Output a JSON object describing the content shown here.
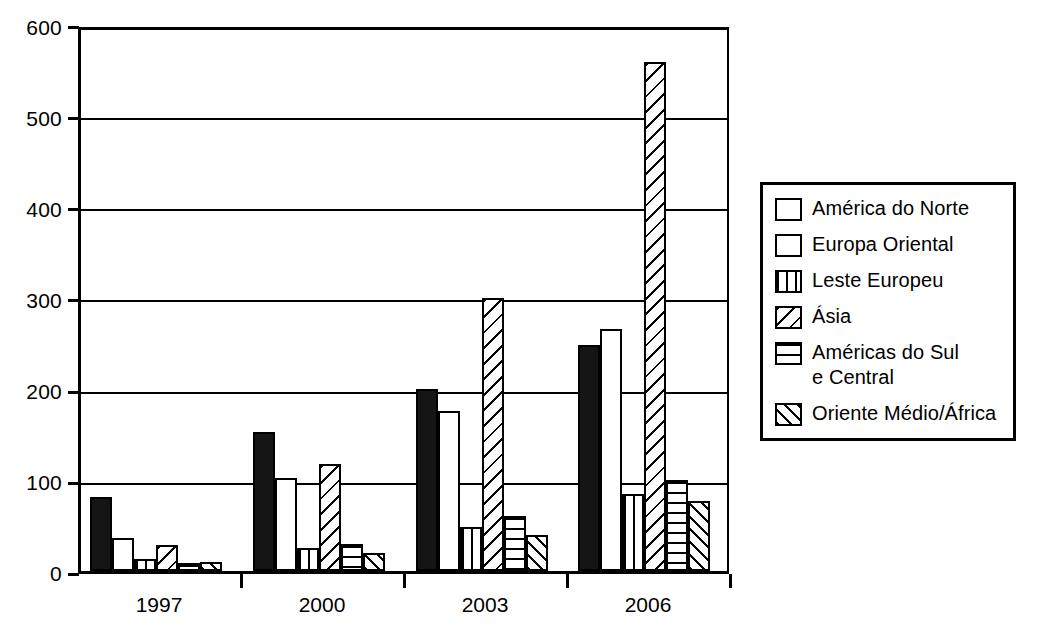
{
  "chart_data": {
    "type": "bar",
    "title": "",
    "subtitle": "",
    "xlabel": "",
    "ylabel": "",
    "categories": [
      "1997",
      "2000",
      "2003",
      "2006"
    ],
    "ylim": [
      0,
      600
    ],
    "yticks": [
      0,
      100,
      200,
      300,
      400,
      500,
      600
    ],
    "ytick_labels": [
      "0",
      "100",
      "200",
      "300",
      "400",
      "500",
      "600"
    ],
    "grid": true,
    "grid_axis": "y",
    "legend_position": "right",
    "series": [
      {
        "name": "América do Norte",
        "pattern": "solid",
        "values": [
          81,
          152,
          200,
          248
        ]
      },
      {
        "name": "Europa Oriental",
        "pattern": "empty",
        "values": [
          36,
          102,
          175,
          266
        ]
      },
      {
        "name": "Leste Europeu",
        "pattern": "vertical-stripes",
        "values": [
          13,
          25,
          48,
          84
        ]
      },
      {
        "name": "Ásia",
        "pattern": "diagonal-wide",
        "values": [
          28,
          117,
          300,
          558
        ]
      },
      {
        "name": "Américas do Sul\ne Central",
        "pattern": "horizontal-stripes",
        "values": [
          9,
          30,
          60,
          100
        ]
      },
      {
        "name": "Oriente Médio/África",
        "pattern": "diagonal-dense",
        "values": [
          10,
          20,
          40,
          77
        ]
      }
    ]
  },
  "legend": {
    "items": [
      {
        "label": "América do Norte",
        "swatch": "solid-black-swatch"
      },
      {
        "label": "Europa Oriental",
        "swatch": "empty-white-swatch"
      },
      {
        "label": "Leste Europeu",
        "swatch": "vertical-stripe-swatch"
      },
      {
        "label": "Ásia",
        "swatch": "diagonal-wide-swatch"
      },
      {
        "label": "Américas do Sul\ne Central",
        "swatch": "horizontal-stripe-swatch"
      },
      {
        "label": "Oriente Médio/África",
        "swatch": "diagonal-dense-swatch"
      }
    ]
  },
  "colors": {
    "axis": "#000000",
    "grid": "#000000",
    "background": "#ffffff",
    "bar_fill_solid": "#151515",
    "bar_fill_empty": "#ffffff"
  }
}
